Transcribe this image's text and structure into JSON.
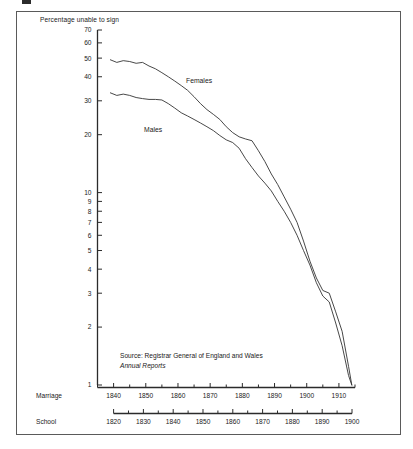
{
  "figure": {
    "y_axis_title": "Percentage unable to sign",
    "source_line1": "Source: Registrar General of England and Wales",
    "source_line2": "Annual Reports",
    "series_label_females": "Females",
    "series_label_males": "Males",
    "axis_name_marriage": "Marriage",
    "axis_name_school": "School",
    "line_color": "#333333",
    "axis_color": "#2b2b2b",
    "frame_color": "#5a5a5a",
    "background": "#ffffff"
  },
  "chart_data": {
    "type": "line",
    "title": "",
    "subtitle": "",
    "xlabel": "Marriage",
    "ylabel": "Percentage unable to sign",
    "yscale": "log",
    "ylim": [
      1,
      70
    ],
    "grid": false,
    "legend": "inline-annotations",
    "ytick_labels": [
      "70",
      "60",
      "50",
      "40",
      "30",
      "20",
      "10",
      "9",
      "8",
      "7",
      "6",
      "5",
      "4",
      "3",
      "2",
      "1"
    ],
    "ytick_values": [
      70,
      60,
      50,
      40,
      30,
      20,
      10,
      9,
      8,
      7,
      6,
      5,
      4,
      3,
      2,
      1
    ],
    "x_axes": [
      {
        "name": "Marriage",
        "tick_labels": [
          "1840",
          "1850",
          "1860",
          "1870",
          "1880",
          "1890",
          "1900",
          "1910"
        ],
        "tick_values": [
          1840,
          1850,
          1860,
          1870,
          1880,
          1890,
          1900,
          1910
        ],
        "minor_tick_step": 5,
        "range": [
          1835,
          1915
        ]
      },
      {
        "name": "School",
        "tick_labels": [
          "1820",
          "1830",
          "1840",
          "1850",
          "1860",
          "1870",
          "1880",
          "1890",
          "1900"
        ],
        "tick_values": [
          1820,
          1830,
          1840,
          1850,
          1860,
          1870,
          1880,
          1890,
          1900
        ],
        "minor_tick_step": 5,
        "range": [
          1820,
          1900
        ]
      }
    ],
    "series": [
      {
        "name": "Females",
        "x": [
          1839,
          1841,
          1843,
          1845,
          1847,
          1849,
          1851,
          1853,
          1855,
          1857,
          1859,
          1861,
          1863,
          1865,
          1867,
          1869,
          1871,
          1873,
          1875,
          1877,
          1879,
          1881,
          1883,
          1885,
          1887,
          1889,
          1891,
          1893,
          1895,
          1897,
          1899,
          1901,
          1903,
          1905,
          1907,
          1909,
          1911,
          1913,
          1914
        ],
        "values": [
          49.0,
          47.5,
          48.5,
          48.0,
          47.0,
          47.5,
          45.5,
          44.0,
          42.0,
          40.0,
          38.0,
          36.0,
          34.0,
          31.5,
          29.0,
          27.0,
          25.5,
          24.0,
          22.0,
          20.5,
          19.5,
          19.0,
          18.6,
          16.5,
          14.5,
          12.5,
          11.0,
          9.5,
          8.2,
          7.0,
          5.6,
          4.4,
          3.6,
          3.1,
          3.0,
          2.4,
          1.9,
          1.25,
          1.0
        ]
      },
      {
        "name": "Males",
        "x": [
          1839,
          1841,
          1843,
          1845,
          1847,
          1849,
          1851,
          1853,
          1855,
          1857,
          1859,
          1861,
          1863,
          1865,
          1867,
          1869,
          1871,
          1873,
          1875,
          1877,
          1879,
          1881,
          1883,
          1885,
          1887,
          1889,
          1891,
          1893,
          1895,
          1897,
          1899,
          1901,
          1903,
          1905,
          1907,
          1909,
          1911,
          1913,
          1914
        ],
        "values": [
          33.0,
          32.0,
          32.5,
          32.0,
          31.2,
          30.8,
          30.5,
          30.5,
          30.3,
          29.0,
          27.5,
          26.0,
          25.0,
          24.0,
          23.0,
          22.0,
          21.0,
          19.8,
          18.8,
          18.2,
          17.0,
          15.0,
          13.5,
          12.2,
          11.2,
          10.2,
          9.0,
          8.0,
          7.0,
          6.0,
          5.0,
          4.2,
          3.4,
          2.9,
          2.7,
          2.1,
          1.6,
          1.12,
          1.0
        ]
      }
    ],
    "annotations": [
      {
        "text": "Females",
        "x": 1868,
        "y": 37
      },
      {
        "text": "Males",
        "x": 1856,
        "y": 20
      },
      {
        "text": "Source: Registrar General of England and Wales",
        "placement": "bottom-left"
      },
      {
        "text": "Annual Reports",
        "placement": "bottom-left",
        "style": "italic"
      }
    ]
  }
}
